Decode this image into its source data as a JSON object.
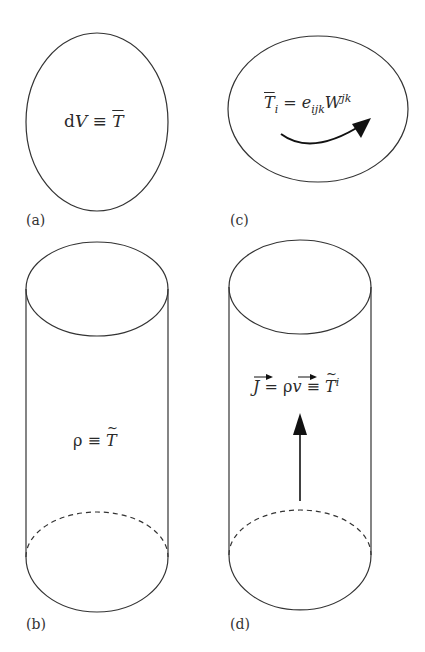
{
  "panels": {
    "a": {
      "label": "(a)",
      "shape": "ellipse",
      "equation": {
        "lhs_d": "d",
        "lhs_v": "V",
        "op": " ≡ ",
        "rhs": "T",
        "rhs_decoration": "overline"
      }
    },
    "b": {
      "label": "(b)",
      "shape": "cylinder",
      "equation": {
        "lhs": "ρ",
        "op": " ≡ ",
        "rhs": "T",
        "rhs_decoration": "tilde"
      }
    },
    "c": {
      "label": "(c)",
      "shape": "ellipse-with-curved-arrow",
      "equation": {
        "lhs": "T",
        "lhs_sub": "i",
        "lhs_decoration": "overline",
        "op": " = ",
        "e": "e",
        "e_sub": "ijk",
        "w": "W",
        "w_sup": "jk"
      }
    },
    "d": {
      "label": "(d)",
      "shape": "cylinder-with-up-arrow",
      "equation": {
        "j": "J",
        "op1": " = ",
        "rho": "ρ",
        "v": "v",
        "op2": " ≡ ",
        "rhs": "T",
        "rhs_sup": "i",
        "rhs_decoration": "tilde"
      }
    }
  },
  "colors": {
    "stroke": "#333333",
    "background": "#ffffff"
  }
}
